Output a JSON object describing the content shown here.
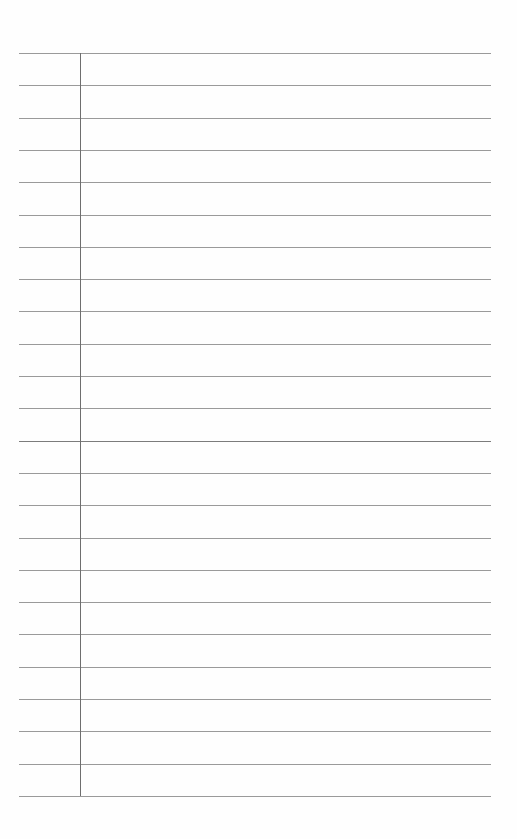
{
  "page": {
    "type": "blank-ruled-paper",
    "rule_count": 24,
    "rule_spacing_px": 32.3,
    "first_rule_y": 53,
    "rule_left_x": 19,
    "rule_right_x": 491,
    "margin_x": 80,
    "colors": {
      "paper": "#fefefe",
      "rule": "#9a9a9a",
      "rule_dark": "#7c7c7c",
      "margin": "#6e6e6e"
    },
    "content": []
  }
}
